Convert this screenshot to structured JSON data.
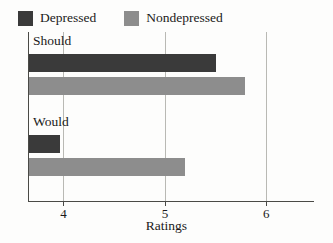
{
  "chart_data": {
    "type": "bar",
    "orientation": "horizontal",
    "title": "",
    "xlabel": "Ratings",
    "ylabel": "",
    "categories": [
      "Should",
      "Would"
    ],
    "series": [
      {
        "name": "Depressed",
        "color": "#3a3a3a",
        "values": [
          5.5,
          3.97
        ]
      },
      {
        "name": "Nondepressed",
        "color": "#8d8d8d",
        "values": [
          5.79,
          5.2
        ]
      }
    ],
    "xlim": [
      3.66,
      6.48
    ],
    "xticks": [
      4,
      5,
      6
    ],
    "xtick_labels": [
      "4",
      "5",
      "6"
    ],
    "grid": "vertical-at-xticks",
    "legend_position": "top-left",
    "axis_color": "#4a4a46",
    "gridline_color": "#b9b9b4",
    "background_color": "#fdfdfc"
  },
  "legend": {
    "items": [
      {
        "label": "Depressed",
        "swatch": "#3a3a3a"
      },
      {
        "label": "Nondepressed",
        "swatch": "#8d8d8d"
      }
    ]
  }
}
